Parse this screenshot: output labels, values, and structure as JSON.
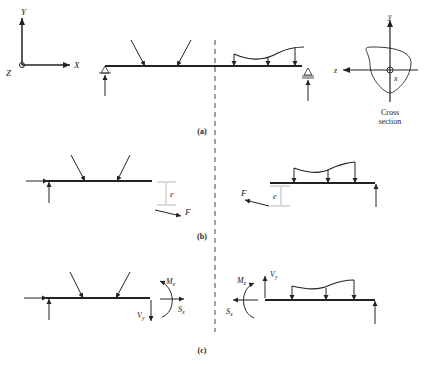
{
  "figure": {
    "panels": [
      {
        "id": "a",
        "caption": "(a)"
      },
      {
        "id": "b",
        "caption": "(b)"
      },
      {
        "id": "c",
        "caption": "(c)"
      }
    ],
    "global_axes": {
      "y": "Y",
      "x": "X",
      "z": "Z"
    },
    "cross_section": {
      "y": "y",
      "z": "z",
      "x": "x",
      "caption_line1": "Cross",
      "caption_line2": "section"
    },
    "panel_b": {
      "eccentricity_left": "e",
      "force_left": "F",
      "eccentricity_right": "e",
      "force_right": "F"
    },
    "panel_c": {
      "left": {
        "moment": "M",
        "moment_sub": "z",
        "shear": "V",
        "shear_sub": "y",
        "axial": "S",
        "axial_sub": "x"
      },
      "right": {
        "moment": "M",
        "moment_sub": "z",
        "shear": "V",
        "shear_sub": "y",
        "axial": "S",
        "axial_sub": "x"
      }
    }
  }
}
